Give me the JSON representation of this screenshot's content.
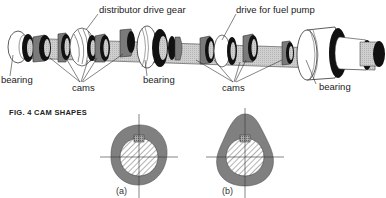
{
  "figure": {
    "title": "FIG. 4   CAM  SHAPES"
  },
  "camshaft": {
    "labels": {
      "distributor_gear": "distributor drive gear",
      "fuel_pump": "drive for fuel pump",
      "bearing_left": "bearing",
      "bearing_middle": "bearing",
      "bearing_right": "bearing",
      "cams_left": "cams",
      "cams_right": "cams"
    }
  },
  "cam_shapes": [
    {
      "id": "a",
      "label": "(a)"
    },
    {
      "id": "b",
      "label": "(b)"
    }
  ],
  "colors": {
    "shaft": "#c8c8c8",
    "cam_gray": "#7a7a7a",
    "black": "#111111",
    "white": "#ffffff",
    "cam_profile": "#808080"
  }
}
